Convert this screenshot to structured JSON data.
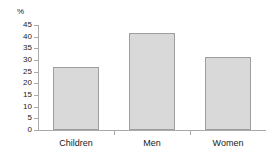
{
  "chart_data": {
    "type": "bar",
    "title": "",
    "subtitle": "",
    "xlabel": "",
    "ylabel": "%",
    "unit_label": "%",
    "categories": [
      "Children",
      "Men",
      "Women"
    ],
    "values": [
      27,
      41.5,
      31.5
    ],
    "series": [
      {
        "name": "",
        "values": [
          27,
          41.5,
          31.5
        ]
      }
    ],
    "ylim": [
      0,
      45
    ],
    "ytick_step": 5,
    "ytick_labels": [
      "45",
      "40",
      "35",
      "30",
      "25",
      "20",
      "15",
      "10",
      "5",
      "0"
    ],
    "ytick_values": [
      45,
      40,
      35,
      30,
      25,
      20,
      15,
      10,
      5,
      0
    ],
    "grid": false,
    "legend": false,
    "legend_position": "none",
    "annotations": [],
    "colors": {
      "bar_fill": "#d9d9d9",
      "bar_border": "#9e9e9e",
      "axis": "#a9a9a9",
      "text": "#1a1a1a",
      "background": "#ffffff"
    }
  }
}
